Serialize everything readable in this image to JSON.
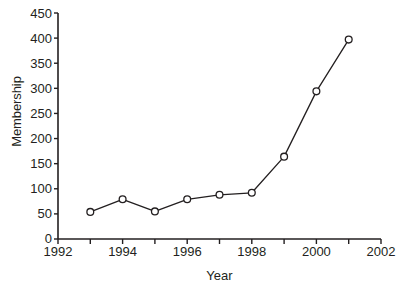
{
  "chart_data": {
    "type": "line",
    "title": "",
    "xlabel": "Year",
    "ylabel": "Membership",
    "x": [
      1993,
      1994,
      1995,
      1996,
      1997,
      1998,
      1999,
      2000,
      2001
    ],
    "values": [
      54,
      79,
      55,
      79,
      88,
      92,
      164,
      294,
      397
    ],
    "series": [
      {
        "name": "Membership",
        "x": [
          1993,
          1994,
          1995,
          1996,
          1997,
          1998,
          1999,
          2000,
          2001
        ],
        "values": [
          54,
          79,
          55,
          79,
          88,
          92,
          164,
          294,
          397
        ]
      }
    ],
    "xlim": [
      1992,
      2002
    ],
    "ylim": [
      0,
      450
    ],
    "xticks": [
      1992,
      1993,
      1994,
      1995,
      1996,
      1997,
      1998,
      1999,
      2000,
      2001,
      2002
    ],
    "xtick_labels_major": [
      "1992",
      "1994",
      "1996",
      "1998",
      "2000",
      "2002"
    ],
    "xticks_major": [
      1992,
      1994,
      1996,
      1998,
      2000,
      2002
    ],
    "yticks": [
      0,
      50,
      100,
      150,
      200,
      250,
      300,
      350,
      400,
      450
    ],
    "ytick_labels": [
      "0",
      "50",
      "100",
      "150",
      "200",
      "250",
      "300",
      "350",
      "400",
      "450"
    ],
    "grid": false,
    "legend": false,
    "legend_position": "none",
    "marker": "open-circle",
    "line_color": "#231f20",
    "marker_face_color": "#ffffff",
    "marker_edge_color": "#231f20",
    "axis_color": "#231f20",
    "background_color": "#ffffff"
  }
}
